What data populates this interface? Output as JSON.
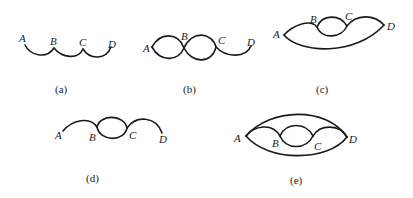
{
  "figures": [
    {
      "id": "a",
      "caption": "(a)",
      "nodes": {
        "A": "A",
        "B": "B",
        "C": "C",
        "D": "D"
      },
      "description": "Series path A-B-C-D with single arcs"
    },
    {
      "id": "b",
      "caption": "(b)",
      "nodes": {
        "A": "A",
        "B": "B",
        "C": "C",
        "D": "D"
      },
      "description": "Double arcs between A-B and B-C, single arc C-D"
    },
    {
      "id": "c",
      "caption": "(c)",
      "nodes": {
        "A": "A",
        "B": "B",
        "C": "C",
        "D": "D"
      },
      "description": "Arcs A-B, double arc B-C, arc C-D, plus long arc A-D"
    },
    {
      "id": "d",
      "caption": "(d)",
      "nodes": {
        "A": "A",
        "B": "B",
        "C": "C",
        "D": "D"
      },
      "description": "Arc A-B, double arc B-C, arc C-D"
    },
    {
      "id": "e",
      "caption": "(e)",
      "nodes": {
        "A": "A",
        "B": "B",
        "C": "C",
        "D": "D"
      },
      "description": "Arcs A-B, double arc B-C, arc C-D, plus upper and lower arcs A-D"
    }
  ],
  "colors": {
    "stroke": "#1a1a1a",
    "background": "#ffffff"
  }
}
